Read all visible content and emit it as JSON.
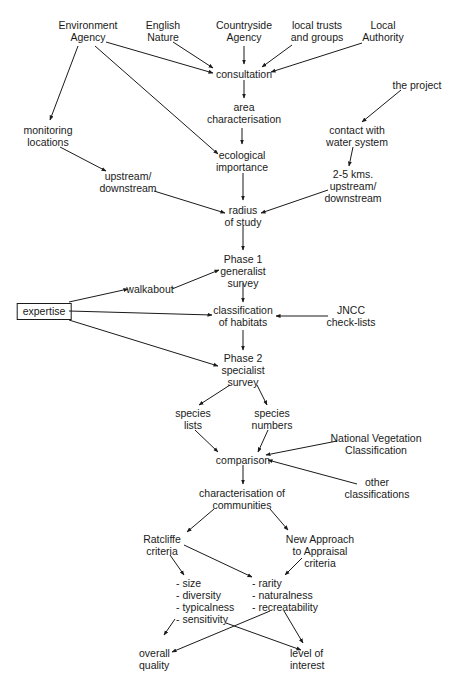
{
  "diagram": {
    "type": "flowchart",
    "nodes": {
      "environment_agency": "Environment\nAgency",
      "english_nature": "English\nNature",
      "countryside_agency": "Countryside\nAgency",
      "local_trusts": "local trusts\nand groups",
      "local_authority": "Local\nAuthority",
      "consultation": "consultation",
      "area_characterisation": "area\ncharacterisation",
      "the_project": "the project",
      "monitoring_locations": "monitoring\nlocations",
      "contact_water": "contact with\nwater system",
      "upstream_downstream": "upstream/\ndownstream",
      "ecological_importance": "ecological\nimportance",
      "kms_upstream": "2-5 kms.\nupstream/\ndownstream",
      "radius_of_study": "radius\nof study",
      "phase1": "Phase 1\ngeneralist\nsurvey",
      "walkabout": "walkabout",
      "expertise": "expertise",
      "classification_habitats": "classification\nof habitats",
      "jncc": "JNCC\ncheck-lists",
      "phase2": "Phase 2\nspecialist\nsurvey",
      "species_lists": "species\nlists",
      "species_numbers": "species\nnumbers",
      "nvc": "National Vegetation\nClassification",
      "comparison": "comparison",
      "other_classifications": "other\nclassifications",
      "characterisation_communities": "characterisation of\ncommunities",
      "ratcliffe": "Ratcliffe\ncriteria",
      "new_approach": "New Approach\nto Appraisal\ncriteria",
      "ratcliffe_list": "- size\n- diversity\n- typicalness\n- sensitivity",
      "nata_list": "- rarity\n- naturalness\n- recreatability",
      "overall_quality": "overall\nquality",
      "level_of_interest": "level of\ninterest"
    },
    "edges": [
      [
        "environment_agency",
        "consultation"
      ],
      [
        "environment_agency",
        "monitoring_locations"
      ],
      [
        "environment_agency",
        "ecological_importance"
      ],
      [
        "english_nature",
        "consultation"
      ],
      [
        "countryside_agency",
        "consultation"
      ],
      [
        "local_trusts",
        "consultation"
      ],
      [
        "local_authority",
        "consultation"
      ],
      [
        "consultation",
        "area_characterisation"
      ],
      [
        "area_characterisation",
        "ecological_importance"
      ],
      [
        "the_project",
        "contact_water"
      ],
      [
        "contact_water",
        "kms_upstream"
      ],
      [
        "monitoring_locations",
        "upstream_downstream"
      ],
      [
        "upstream_downstream",
        "radius_of_study"
      ],
      [
        "ecological_importance",
        "radius_of_study"
      ],
      [
        "kms_upstream",
        "radius_of_study"
      ],
      [
        "radius_of_study",
        "phase1"
      ],
      [
        "expertise",
        "walkabout"
      ],
      [
        "walkabout",
        "phase1"
      ],
      [
        "expertise",
        "classification_habitats"
      ],
      [
        "expertise",
        "phase2"
      ],
      [
        "phase1",
        "classification_habitats"
      ],
      [
        "jncc",
        "classification_habitats"
      ],
      [
        "classification_habitats",
        "phase2"
      ],
      [
        "phase2",
        "species_lists"
      ],
      [
        "phase2",
        "species_numbers"
      ],
      [
        "species_lists",
        "comparison"
      ],
      [
        "species_numbers",
        "comparison"
      ],
      [
        "nvc",
        "comparison"
      ],
      [
        "other_classifications",
        "comparison"
      ],
      [
        "comparison",
        "characterisation_communities"
      ],
      [
        "characterisation_communities",
        "ratcliffe"
      ],
      [
        "characterisation_communities",
        "new_approach"
      ],
      [
        "ratcliffe",
        "ratcliffe_list"
      ],
      [
        "ratcliffe",
        "nata_list"
      ],
      [
        "new_approach",
        "nata_list"
      ],
      [
        "ratcliffe_list",
        "overall_quality"
      ],
      [
        "ratcliffe_list",
        "level_of_interest"
      ],
      [
        "nata_list",
        "overall_quality"
      ],
      [
        "nata_list",
        "level_of_interest"
      ]
    ]
  }
}
